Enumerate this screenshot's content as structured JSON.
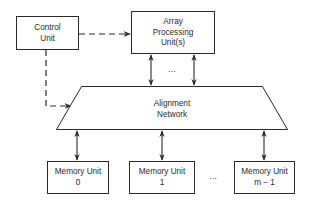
{
  "diagram": {
    "type": "block-diagram",
    "colors": {
      "stroke": "#2a2a2a",
      "background": "#ffffff"
    },
    "nodes": {
      "control_unit": {
        "line1": "Control",
        "line2": "Unit"
      },
      "array_processing_unit": {
        "line1": "Array",
        "line2": "Processing",
        "line3": "Unit(s)"
      },
      "alignment_network": {
        "line1": "Alignment",
        "line2": "Network"
      },
      "memory_units": [
        {
          "line1": "Memory Unit",
          "line2": "0"
        },
        {
          "line1": "Memory Unit",
          "line2": "1"
        },
        {
          "line1": "Memory Unit",
          "line2_var": "m",
          "line2_rest": " − 1"
        }
      ]
    },
    "ellipsis_top": "…",
    "ellipsis_bottom": "…",
    "edges": [
      {
        "from": "Control Unit",
        "to": "Array Processing Unit(s)",
        "style": "dashed",
        "direction": "one-way"
      },
      {
        "from": "Control Unit",
        "to": "Alignment Network",
        "style": "dashed",
        "direction": "one-way"
      },
      {
        "from": "Array Processing Unit(s)",
        "to": "Alignment Network",
        "style": "solid",
        "direction": "bidirectional",
        "count": "multiple"
      },
      {
        "from": "Alignment Network",
        "to": "Memory Unit 0",
        "style": "solid",
        "direction": "bidirectional"
      },
      {
        "from": "Alignment Network",
        "to": "Memory Unit 1",
        "style": "solid",
        "direction": "bidirectional"
      },
      {
        "from": "Alignment Network",
        "to": "Memory Unit m − 1",
        "style": "solid",
        "direction": "bidirectional"
      }
    ]
  }
}
